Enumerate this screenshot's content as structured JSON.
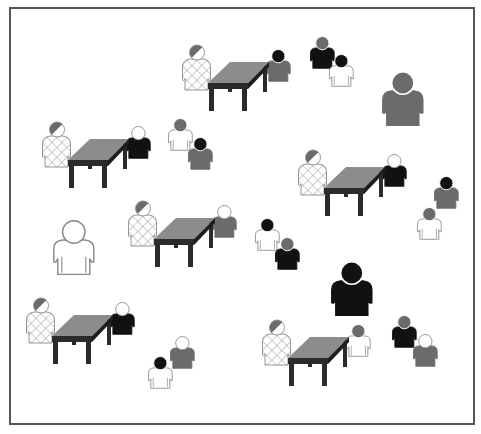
{
  "canvas": {
    "width": 481,
    "height": 434,
    "background": "#ffffff"
  },
  "frame": {
    "x": 10,
    "y": 8,
    "width": 464,
    "height": 416,
    "stroke": "#555555",
    "stroke_width": 2
  },
  "colors": {
    "black": "#111111",
    "gray": "#6b6b6b",
    "white": "#ffffff",
    "outline": "#8a8a8a",
    "table_top": "#8c8c8c",
    "table_frame": "#2b2b2b",
    "hatch": "#9a9a9a"
  },
  "table_groups": [
    {
      "id": "group-1",
      "x": 182,
      "y": 45,
      "scale": 1.0,
      "right_person": {
        "head": "black",
        "body": "gray"
      }
    },
    {
      "id": "group-2",
      "x": 42,
      "y": 122,
      "scale": 1.0,
      "right_person": {
        "head": "white",
        "body": "black"
      }
    },
    {
      "id": "group-3",
      "x": 298,
      "y": 150,
      "scale": 1.0,
      "right_person": {
        "head": "white",
        "body": "black"
      }
    },
    {
      "id": "group-4",
      "x": 128,
      "y": 201,
      "scale": 1.0,
      "right_person": {
        "head": "white",
        "body": "gray"
      }
    },
    {
      "id": "group-5",
      "x": 26,
      "y": 298,
      "scale": 1.0,
      "right_person": {
        "head": "white",
        "body": "black"
      }
    },
    {
      "id": "group-6",
      "x": 262,
      "y": 320,
      "scale": 1.0,
      "right_person": {
        "head": "gray",
        "body": "white"
      }
    }
  ],
  "standing_pairs": [
    {
      "id": "pair-1",
      "back": {
        "x": 310,
        "y": 36,
        "head": "gray",
        "body": "black"
      },
      "front": {
        "x": 329,
        "y": 54,
        "head": "black",
        "body": "white"
      }
    },
    {
      "id": "pair-2",
      "back": {
        "x": 168,
        "y": 118,
        "head": "gray",
        "body": "white"
      },
      "front": {
        "x": 188,
        "y": 137,
        "head": "black",
        "body": "gray"
      }
    },
    {
      "id": "pair-3",
      "back": {
        "x": 434,
        "y": 176,
        "head": "black",
        "body": "gray"
      },
      "front": {
        "x": 417,
        "y": 207,
        "head": "gray",
        "body": "white"
      }
    },
    {
      "id": "pair-4",
      "back": {
        "x": 255,
        "y": 218,
        "head": "black",
        "body": "white"
      },
      "front": {
        "x": 275,
        "y": 237,
        "head": "gray",
        "body": "black"
      }
    },
    {
      "id": "pair-5",
      "back": {
        "x": 170,
        "y": 336,
        "head": "white",
        "body": "gray"
      },
      "front": {
        "x": 148,
        "y": 356,
        "head": "black",
        "body": "white"
      }
    },
    {
      "id": "pair-6",
      "back": {
        "x": 392,
        "y": 315,
        "head": "gray",
        "body": "black"
      },
      "front": {
        "x": 413,
        "y": 334,
        "head": "white",
        "body": "gray"
      }
    }
  ],
  "single_people": [
    {
      "id": "person-large-gray",
      "x": 382,
      "y": 71,
      "scale": 1.6,
      "head": "gray",
      "body": "gray"
    },
    {
      "id": "person-large-white",
      "x": 53,
      "y": 220,
      "scale": 1.6,
      "head": "white",
      "body": "white"
    },
    {
      "id": "person-large-black",
      "x": 331,
      "y": 261,
      "scale": 1.6,
      "head": "black",
      "body": "black"
    }
  ]
}
